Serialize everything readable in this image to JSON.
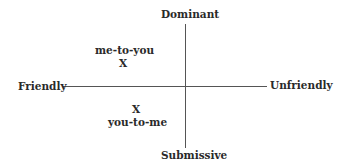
{
  "diagram": {
    "axes": {
      "top": "Dominant",
      "bottom": "Submissive",
      "left": "Friendly",
      "right": "Unfriendly"
    },
    "points": [
      {
        "marker": "X",
        "label": "me-to-you",
        "quadrant": "friendly-dominant"
      },
      {
        "marker": "X",
        "label": "you-to-me",
        "quadrant": "friendly-submissive"
      }
    ]
  }
}
